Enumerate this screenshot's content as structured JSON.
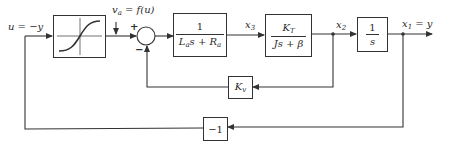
{
  "diagram": {
    "type": "block-diagram",
    "signals": {
      "input_label": "u = −y",
      "va_label": "v",
      "va_sub": "a",
      "va_rest": " = f(u)",
      "x3": "x",
      "x3_sub": "3",
      "x2": "x",
      "x2_sub": "2",
      "x1": "x",
      "x1_sub": "1",
      "x1_rest": " = y"
    },
    "summing_junction": {
      "plus": "+",
      "minus": "−"
    },
    "blocks": {
      "saturation": {
        "name": "nonlinearity f(u)"
      },
      "armature": {
        "numerator": "1",
        "den_L": "L",
        "den_L_sub": "a",
        "den_s": "s + ",
        "den_R": "R",
        "den_R_sub": "a"
      },
      "mechanical": {
        "num_K": "K",
        "num_K_sub": "T",
        "denominator": "Js + β"
      },
      "integrator": {
        "numerator": "1",
        "denominator": "s"
      },
      "back_emf": {
        "K": "K",
        "K_sub": "v"
      },
      "negation": {
        "label": "−1"
      }
    },
    "line_color": "#333333"
  }
}
